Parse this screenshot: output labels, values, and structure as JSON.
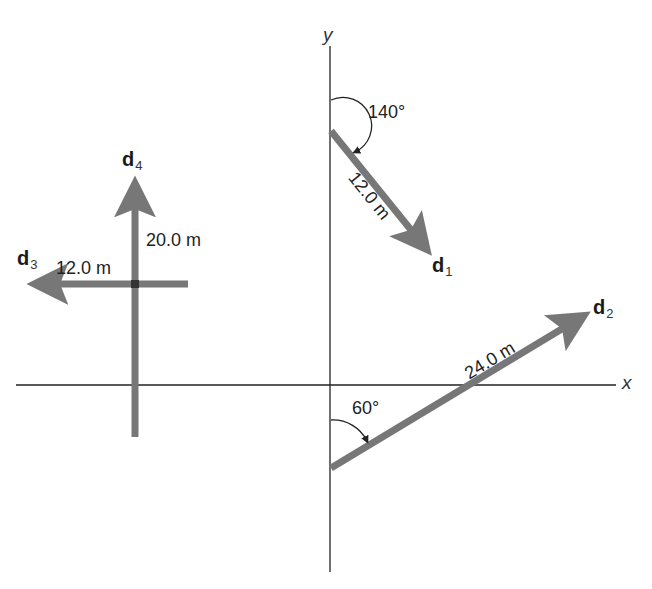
{
  "axes": {
    "x_label": "x",
    "y_label": "y"
  },
  "colors": {
    "vector": "#777777",
    "axis": "#222222",
    "text": "#222222"
  },
  "vectors": [
    {
      "name": "d",
      "sub": "1",
      "magnitude": "12.0 m",
      "angle_label": "140°"
    },
    {
      "name": "d",
      "sub": "2",
      "magnitude": "24.0 m",
      "angle_label": "60°"
    },
    {
      "name": "d",
      "sub": "3",
      "magnitude": "12.0 m"
    },
    {
      "name": "d",
      "sub": "4",
      "magnitude": "20.0 m"
    }
  ]
}
